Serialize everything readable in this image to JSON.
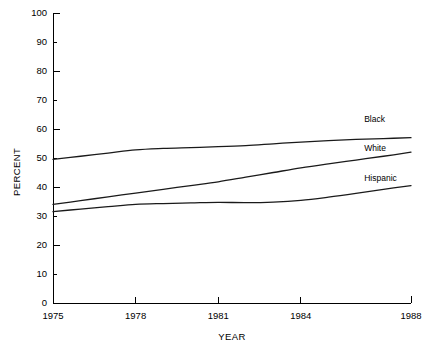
{
  "chart_data": {
    "type": "line",
    "title": "",
    "xlabel": "YEAR",
    "ylabel": "PERCENT",
    "xlim": [
      1975,
      1988
    ],
    "ylim": [
      0,
      100
    ],
    "grid": false,
    "legend_position": "inline-right",
    "x_ticks": [
      1975,
      1978,
      1981,
      1984,
      1988
    ],
    "x_tick_labels": [
      "1975",
      "1978",
      "1981",
      "1984",
      "1988"
    ],
    "y_ticks": [
      0,
      10,
      20,
      30,
      40,
      50,
      60,
      70,
      80,
      90,
      100
    ],
    "y_tick_labels": [
      "0",
      "10",
      "20",
      "30",
      "40",
      "50",
      "60",
      "70",
      "80",
      "90",
      "100"
    ],
    "x": [
      1975,
      1976,
      1977,
      1978,
      1979,
      1980,
      1981,
      1982,
      1983,
      1984,
      1985,
      1986,
      1987,
      1988
    ],
    "series": [
      {
        "name": "Black",
        "label": "Black",
        "color": "#1a1a1a",
        "values": [
          49.5,
          50.6,
          51.7,
          52.8,
          53.3,
          53.6,
          53.9,
          54.3,
          54.9,
          55.5,
          56.0,
          56.4,
          56.7,
          57.0
        ]
      },
      {
        "name": "White",
        "label": "White",
        "color": "#1a1a1a",
        "values": [
          34.0,
          35.3,
          36.6,
          37.9,
          39.2,
          40.5,
          41.8,
          43.4,
          45.0,
          46.6,
          48.0,
          49.3,
          50.6,
          52.0
        ]
      },
      {
        "name": "Hispanic",
        "label": "Hispanic",
        "color": "#1a1a1a",
        "values": [
          31.5,
          32.4,
          33.2,
          34.0,
          34.3,
          34.5,
          34.7,
          34.6,
          34.8,
          35.4,
          36.5,
          37.8,
          39.2,
          40.5
        ]
      }
    ],
    "series_label_positions": [
      {
        "name": "Black",
        "x": 1986.3,
        "y": 62.5
      },
      {
        "name": "White",
        "x": 1986.3,
        "y": 52.5
      },
      {
        "name": "Hispanic",
        "x": 1986.3,
        "y": 42.0
      }
    ]
  },
  "axis": {
    "y_title": "PERCENT",
    "x_title": "YEAR"
  }
}
